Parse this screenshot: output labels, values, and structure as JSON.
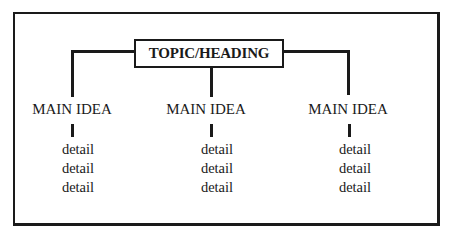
{
  "diagram": {
    "type": "hierarchy",
    "heading": "TOPIC/HEADING",
    "columns": [
      {
        "main_idea": "MAIN IDEA",
        "details": [
          "detail",
          "detail",
          "detail"
        ]
      },
      {
        "main_idea": "MAIN IDEA",
        "details": [
          "detail",
          "detail",
          "detail"
        ]
      },
      {
        "main_idea": "MAIN IDEA",
        "details": [
          "detail",
          "detail",
          "detail"
        ]
      }
    ],
    "colors": {
      "line": "#1a1a1a",
      "background": "#ffffff"
    }
  }
}
